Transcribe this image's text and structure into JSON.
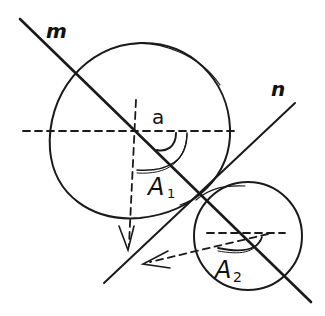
{
  "diagram": {
    "labels": {
      "line_m": "m",
      "line_n": "n",
      "angle_a": "a",
      "a1_main": "A",
      "a1_sub": "1",
      "a2_main": "A",
      "a2_sub": "2"
    },
    "colors": {
      "ink": "#1a1a1a",
      "background": "#ffffff"
    },
    "elements": [
      "line m (diagonal, top-left to bottom-right)",
      "line n (diagonal, tangent line from bottom-left to top-right)",
      "large circle",
      "small circle",
      "dashed horizontal axis through large circle center",
      "dashed vertical axis with downward arrow",
      "dashed horizontal line in small circle",
      "dashed slanted arrow pointing down-left",
      "angle arcs A1 and A2"
    ]
  }
}
